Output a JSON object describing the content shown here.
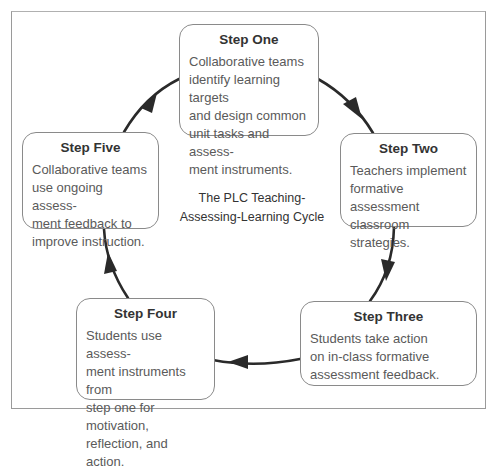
{
  "diagram": {
    "center_title": "The PLC Teaching-\nAssessing-Learning Cycle",
    "steps": [
      {
        "title": "Step One",
        "body": "Collaborative teams\nidentify learning targets\nand design common\nunit tasks and assess-\nment instruments."
      },
      {
        "title": "Step Two",
        "body": "Teachers implement\nformative assessment\nclassroom strategies."
      },
      {
        "title": "Step Three",
        "body": "Students take action\non in-class formative\nassessment feedback."
      },
      {
        "title": "Step Four",
        "body": "Students use assess-\nment instruments from\nstep one for motivation,\nreflection, and action."
      },
      {
        "title": "Step Five",
        "body": "Collaborative teams\nuse ongoing assess-\nment feedback to\nimprove instruction."
      }
    ],
    "arrows": [
      {
        "from": "Step One",
        "to": "Step Two"
      },
      {
        "from": "Step Two",
        "to": "Step Three"
      },
      {
        "from": "Step Three",
        "to": "Step Four"
      },
      {
        "from": "Step Four",
        "to": "Step Five"
      },
      {
        "from": "Step Five",
        "to": "Step One"
      }
    ],
    "colors": {
      "arrow": "#2a2a2a",
      "border": "#8a8a8a",
      "text": "#5a5a5a",
      "title": "#333333"
    }
  }
}
